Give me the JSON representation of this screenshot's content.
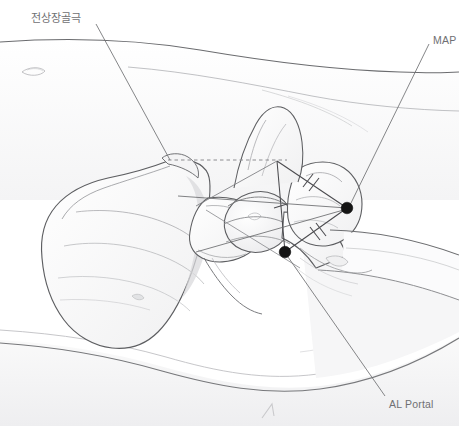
{
  "figure": {
    "background_color": "#ffffff",
    "width": 459,
    "height": 426
  },
  "labels": [
    {
      "id": "asis",
      "text": "전상장골극",
      "language": "ko",
      "meaning": "anterior superior iliac spine",
      "color": "#6f7073",
      "x": 31,
      "y": 13,
      "leader_from": [
        95,
        24
      ],
      "leader_to": [
        170,
        160
      ]
    },
    {
      "id": "map",
      "text": "MAP",
      "language": "en",
      "color": "#6f7073",
      "x": 433,
      "y": 35,
      "leader_from": [
        428,
        44
      ],
      "leader_to": [
        350,
        206
      ]
    },
    {
      "id": "al-portal",
      "text": "AL Portal",
      "language": "en",
      "color": "#6f7073",
      "x": 389,
      "y": 399,
      "leader_from": [
        385,
        396
      ],
      "leader_to": [
        288,
        256
      ]
    }
  ],
  "markers": [
    {
      "id": "map-point",
      "label": "MAP",
      "x": 347,
      "y": 208,
      "radius": 6,
      "color": "#1a1a1a"
    },
    {
      "id": "al-portal-point",
      "label": "AL Portal",
      "x": 285,
      "y": 252,
      "radius": 6,
      "color": "#1a1a1a"
    }
  ],
  "geometry": {
    "asis_point": {
      "x": 170,
      "y": 160
    },
    "apex_point": {
      "x": 277,
      "y": 162
    },
    "dashed_line": {
      "x1": 168,
      "y1": 160,
      "x2": 286,
      "y2": 160,
      "style": "dashed",
      "color": "#8c8c90"
    },
    "vertical_line": {
      "x1": 277,
      "y1": 162,
      "x2": 285,
      "y2": 252,
      "tick_marks": 1
    },
    "side_map": {
      "from": "apex_point",
      "to": "map-point",
      "tick_marks": 2
    },
    "side_al": {
      "from": "map-point",
      "to": "al-portal-point",
      "tick_marks": 2
    },
    "line_color": "#4a4a4e"
  },
  "anatomy": {
    "structures": [
      "skin contour (upper)",
      "skin contour (lower)",
      "iliac wing",
      "anterior superior iliac spine",
      "femoral head",
      "greater trochanter",
      "femoral shaft",
      "hip joint capsule"
    ],
    "outline_color": "#5c5d60",
    "shade_color": "#f2f2f3"
  },
  "bottom_arrow": {
    "x": 268,
    "y": 410,
    "color": "#c9c9cc",
    "direction": "up-right"
  }
}
